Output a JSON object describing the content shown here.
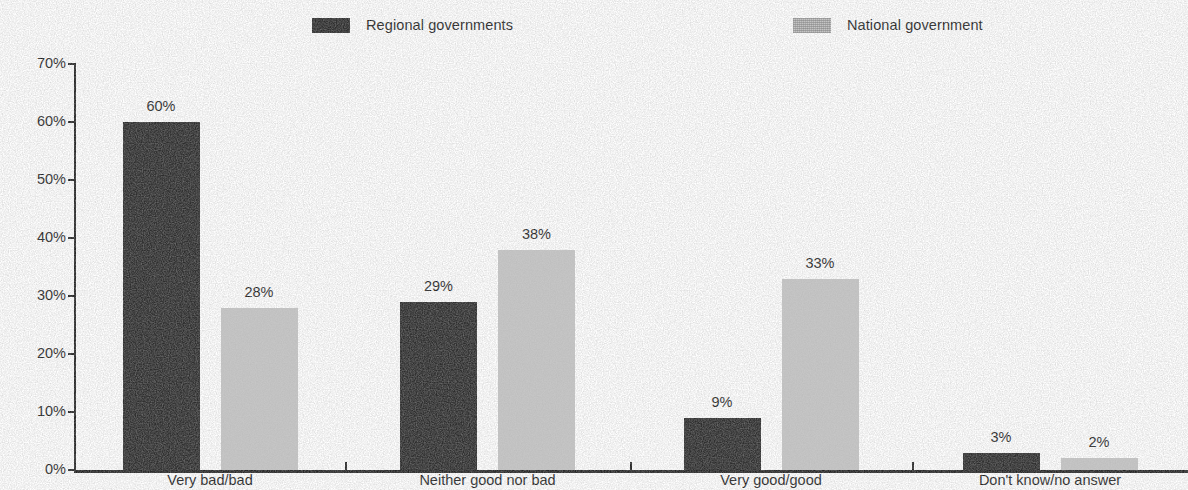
{
  "chart_data": {
    "type": "bar",
    "title": "",
    "subtitle": "",
    "xlabel": "",
    "ylabel": "",
    "ylim": [
      0,
      70
    ],
    "ytick_labels": [
      "0%",
      "10%",
      "20%",
      "30%",
      "40%",
      "50%",
      "60%",
      "70%"
    ],
    "ytick_values": [
      0,
      10,
      20,
      30,
      40,
      50,
      60,
      70
    ],
    "grid": false,
    "legend_position": "top-center",
    "value_label_suffix": "%",
    "categories": [
      "Very bad/bad",
      "Neither good nor bad",
      "Very good/good",
      "Don't know/no answer"
    ],
    "series": [
      {
        "name": "Regional governments",
        "color": "#2d2d2d",
        "values": [
          60,
          29,
          9,
          3
        ],
        "value_labels": [
          "60%",
          "29%",
          "9%",
          "3%"
        ]
      },
      {
        "name": "National government",
        "color": "#c6c6c6",
        "values": [
          28,
          38,
          33,
          2
        ],
        "value_labels": [
          "28%",
          "38%",
          "33%",
          "2%"
        ]
      }
    ]
  },
  "legend": {
    "items": [
      {
        "label": "Regional governments",
        "swatch": "dark-swatch-icon"
      },
      {
        "label": "National government",
        "swatch": "light-swatch-icon"
      }
    ]
  }
}
